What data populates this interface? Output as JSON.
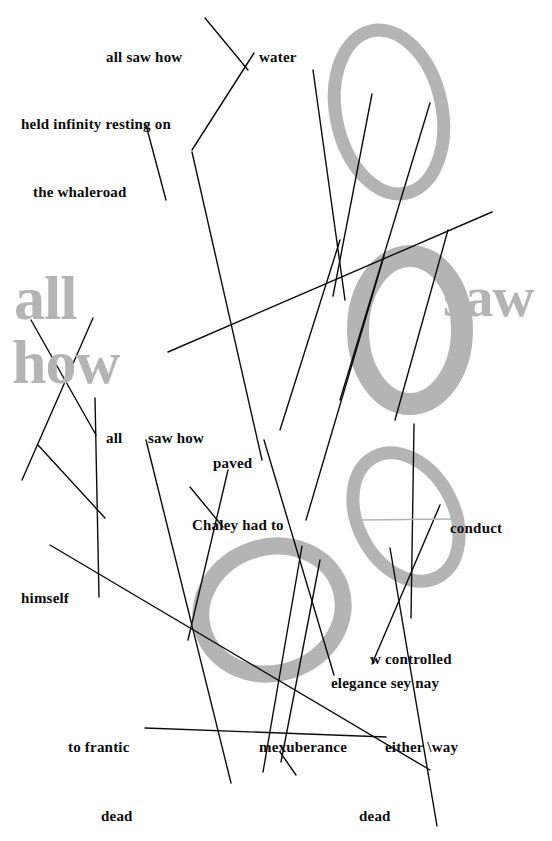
{
  "page": {
    "width": 552,
    "height": 841,
    "background_color": "#fefefe",
    "ink_color": "#0c0c0c",
    "grey_color": "#b4b4b4",
    "edge_margin_note": "| | | 32 | | |"
  },
  "big_text": {
    "all": "all",
    "how": "how",
    "saw": "saw",
    "ring_letter_o": "O"
  },
  "labels": [
    {
      "id": "all-saw-how-top",
      "text": "all saw how",
      "x": 106,
      "y": 50,
      "size": 15
    },
    {
      "id": "water",
      "text": "water",
      "x": 259,
      "y": 50,
      "size": 15
    },
    {
      "id": "held-infinity",
      "text": "held infinity resting on",
      "x": 21,
      "y": 117,
      "size": 15
    },
    {
      "id": "the-whaleroad",
      "text": "the whaleroad",
      "x": 33,
      "y": 185,
      "size": 15
    },
    {
      "id": "all-mid",
      "text": "all",
      "x": 106,
      "y": 431,
      "size": 15
    },
    {
      "id": "saw-how-mid",
      "text": "saw how",
      "x": 148,
      "y": 431,
      "size": 15
    },
    {
      "id": "paved",
      "text": "paved",
      "x": 213,
      "y": 456,
      "size": 15
    },
    {
      "id": "chaley-had-to",
      "text": "Chaley had to",
      "x": 192,
      "y": 518,
      "size": 15
    },
    {
      "id": "conduct",
      "text": "conduct",
      "x": 450,
      "y": 521,
      "size": 15
    },
    {
      "id": "himself",
      "text": "himself",
      "x": 21,
      "y": 591,
      "size": 15
    },
    {
      "id": "w-controlled",
      "text": "w  controlled",
      "x": 370,
      "y": 652,
      "size": 15
    },
    {
      "id": "elegance-sey-nay",
      "text": "elegance sey nay",
      "x": 331,
      "y": 676,
      "size": 15
    },
    {
      "id": "to-frantic",
      "text": "to frantic",
      "x": 68,
      "y": 740,
      "size": 15
    },
    {
      "id": "mexuberance",
      "text": "mexuberance",
      "x": 259,
      "y": 740,
      "size": 15
    },
    {
      "id": "either-way",
      "text": "either \\way",
      "x": 385,
      "y": 740,
      "size": 15
    },
    {
      "id": "dead-left",
      "text": "dead",
      "x": 101,
      "y": 809,
      "size": 15
    },
    {
      "id": "dead-right",
      "text": "dead",
      "x": 359,
      "y": 809,
      "size": 15
    }
  ],
  "big_words": [
    {
      "id": "big-all",
      "text": "all",
      "x": 14,
      "y": 267,
      "size": 62
    },
    {
      "id": "big-how",
      "text": "how",
      "x": 12,
      "y": 331,
      "size": 62
    },
    {
      "id": "big-saw",
      "text": "saw",
      "x": 443,
      "y": 268,
      "size": 58
    }
  ],
  "rings": [
    {
      "id": "ring-top",
      "cx": 389,
      "cy": 112,
      "rx": 53,
      "ry": 83,
      "rotation": -12,
      "thickness": 13,
      "color": "#b4b4b4"
    },
    {
      "id": "ring-letter-o",
      "cx": 410,
      "cy": 330,
      "rx": 52,
      "ry": 74,
      "rotation": 0,
      "thickness": 22,
      "color": "#b4b4b4"
    },
    {
      "id": "ring-middle",
      "cx": 406,
      "cy": 517,
      "rx": 48,
      "ry": 68,
      "rotation": -28,
      "thickness": 13,
      "color": "#b4b4b4"
    },
    {
      "id": "ring-bottom",
      "cx": 272,
      "cy": 610,
      "rx": 72,
      "ry": 63,
      "rotation": -18,
      "thickness": 17,
      "color": "#b4b4b4"
    }
  ],
  "strokes": [
    {
      "id": "s01",
      "x1": 205,
      "y1": 18,
      "x2": 248,
      "y2": 70
    },
    {
      "id": "s02",
      "x1": 254,
      "y1": 53,
      "x2": 192,
      "y2": 150
    },
    {
      "id": "s03",
      "x1": 313,
      "y1": 70,
      "x2": 345,
      "y2": 300
    },
    {
      "id": "s04",
      "x1": 372,
      "y1": 94,
      "x2": 333,
      "y2": 296
    },
    {
      "id": "s05",
      "x1": 430,
      "y1": 103,
      "x2": 340,
      "y2": 400
    },
    {
      "id": "s06",
      "x1": 192,
      "y1": 152,
      "x2": 262,
      "y2": 460
    },
    {
      "id": "s07",
      "x1": 146,
      "y1": 125,
      "x2": 166,
      "y2": 200
    },
    {
      "id": "s08",
      "x1": 168,
      "y1": 352,
      "x2": 492,
      "y2": 212
    },
    {
      "id": "s09",
      "x1": 340,
      "y1": 240,
      "x2": 280,
      "y2": 430
    },
    {
      "id": "s10",
      "x1": 448,
      "y1": 230,
      "x2": 395,
      "y2": 420
    },
    {
      "id": "s11",
      "x1": 384,
      "y1": 256,
      "x2": 306,
      "y2": 520
    },
    {
      "id": "s12",
      "x1": 31,
      "y1": 320,
      "x2": 96,
      "y2": 435
    },
    {
      "id": "s13",
      "x1": 93,
      "y1": 318,
      "x2": 22,
      "y2": 480
    },
    {
      "id": "s14",
      "x1": 38,
      "y1": 445,
      "x2": 105,
      "y2": 518
    },
    {
      "id": "s15",
      "x1": 95,
      "y1": 398,
      "x2": 99,
      "y2": 597
    },
    {
      "id": "s16",
      "x1": 146,
      "y1": 440,
      "x2": 231,
      "y2": 783
    },
    {
      "id": "s17",
      "x1": 228,
      "y1": 470,
      "x2": 188,
      "y2": 640
    },
    {
      "id": "s18",
      "x1": 264,
      "y1": 440,
      "x2": 334,
      "y2": 675
    },
    {
      "id": "s19",
      "x1": 190,
      "y1": 487,
      "x2": 223,
      "y2": 527
    },
    {
      "id": "s20",
      "x1": 50,
      "y1": 545,
      "x2": 430,
      "y2": 770
    },
    {
      "id": "s21",
      "x1": 145,
      "y1": 728,
      "x2": 386,
      "y2": 737
    },
    {
      "id": "s22",
      "x1": 302,
      "y1": 546,
      "x2": 263,
      "y2": 772
    },
    {
      "id": "s23",
      "x1": 390,
      "y1": 548,
      "x2": 437,
      "y2": 826
    },
    {
      "id": "s24",
      "x1": 414,
      "y1": 424,
      "x2": 411,
      "y2": 618
    },
    {
      "id": "s25",
      "x1": 320,
      "y1": 560,
      "x2": 281,
      "y2": 762
    },
    {
      "id": "s26",
      "x1": 280,
      "y1": 752,
      "x2": 296,
      "y2": 775
    },
    {
      "id": "s27",
      "x1": 440,
      "y1": 505,
      "x2": 372,
      "y2": 664
    },
    {
      "id": "s28",
      "x1": 362,
      "y1": 520,
      "x2": 452,
      "y2": 519,
      "color": "#b4b4b4"
    }
  ]
}
